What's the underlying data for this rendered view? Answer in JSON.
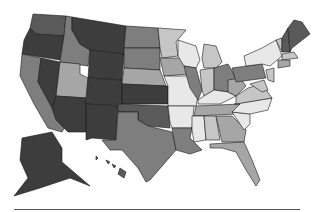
{
  "map": {
    "title": "",
    "type": "choropleth",
    "region": "United States",
    "palette": {
      "darkest": "#3d3d3d",
      "dark": "#5a5a5a",
      "medium": "#7e7e7e",
      "light": "#a6a6a6",
      "lighter": "#c6c6c6",
      "lightest": "#e8e8e8",
      "border": "#1a1a1a"
    },
    "states": [
      {
        "id": "WA",
        "shade": "dark"
      },
      {
        "id": "OR",
        "shade": "darkest"
      },
      {
        "id": "CA",
        "shade": "medium"
      },
      {
        "id": "NV",
        "shade": "darkest"
      },
      {
        "id": "ID",
        "shade": "medium"
      },
      {
        "id": "MT",
        "shade": "darkest"
      },
      {
        "id": "WY",
        "shade": "darkest"
      },
      {
        "id": "UT",
        "shade": "light"
      },
      {
        "id": "AZ",
        "shade": "darkest"
      },
      {
        "id": "CO",
        "shade": "darkest"
      },
      {
        "id": "NM",
        "shade": "darkest"
      },
      {
        "id": "ND",
        "shade": "medium"
      },
      {
        "id": "SD",
        "shade": "medium"
      },
      {
        "id": "NE",
        "shade": "light"
      },
      {
        "id": "KS",
        "shade": "darkest"
      },
      {
        "id": "OK",
        "shade": "dark"
      },
      {
        "id": "TX",
        "shade": "medium"
      },
      {
        "id": "MN",
        "shade": "lighter"
      },
      {
        "id": "IA",
        "shade": "light"
      },
      {
        "id": "MO",
        "shade": "lightest"
      },
      {
        "id": "AR",
        "shade": "lightest"
      },
      {
        "id": "LA",
        "shade": "medium"
      },
      {
        "id": "WI",
        "shade": "lightest"
      },
      {
        "id": "IL",
        "shade": "medium"
      },
      {
        "id": "MI",
        "shade": "lighter"
      },
      {
        "id": "IN",
        "shade": "lighter"
      },
      {
        "id": "OH",
        "shade": "medium"
      },
      {
        "id": "KY",
        "shade": "lightest"
      },
      {
        "id": "TN",
        "shade": "light"
      },
      {
        "id": "MS",
        "shade": "lightest"
      },
      {
        "id": "AL",
        "shade": "lighter"
      },
      {
        "id": "GA",
        "shade": "light"
      },
      {
        "id": "FL",
        "shade": "light"
      },
      {
        "id": "SC",
        "shade": "lightest"
      },
      {
        "id": "NC",
        "shade": "lightest"
      },
      {
        "id": "VA",
        "shade": "lighter"
      },
      {
        "id": "WV",
        "shade": "light"
      },
      {
        "id": "PA",
        "shade": "medium"
      },
      {
        "id": "NY",
        "shade": "lightest"
      },
      {
        "id": "VT",
        "shade": "lighter"
      },
      {
        "id": "NH",
        "shade": "dark"
      },
      {
        "id": "ME",
        "shade": "dark"
      },
      {
        "id": "MA",
        "shade": "lighter"
      },
      {
        "id": "CT",
        "shade": "light"
      },
      {
        "id": "NJ",
        "shade": "lighter"
      },
      {
        "id": "MD",
        "shade": "lighter"
      },
      {
        "id": "AK",
        "shade": "darkest"
      },
      {
        "id": "HI",
        "shade": "dark"
      }
    ],
    "watermark": "",
    "footer_rule": true
  }
}
